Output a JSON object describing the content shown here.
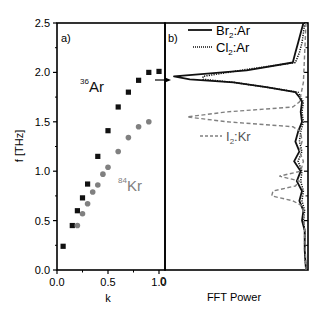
{
  "figure": {
    "panel_a_label": "a)",
    "panel_b_label": "b)",
    "ylabel": "f [THz]",
    "xlabel_a": "k",
    "xlabel_b": "FFT Power",
    "annot_ar_sup": "36",
    "annot_ar": "Ar",
    "annot_kr_sup": "84",
    "annot_kr": "Kr",
    "legend": [
      {
        "main": "Br",
        "sub": "2",
        "rest": ":Ar",
        "style": "solid"
      },
      {
        "main": "Cl",
        "sub": "2",
        "rest": ":Ar",
        "style": "dotted"
      },
      {
        "main": "I",
        "sub": "2",
        "rest": ":Kr",
        "style": "dashed"
      }
    ],
    "colors": {
      "ar": "#111111",
      "kr": "#808080",
      "axis": "#000000"
    }
  },
  "chart_data": [
    {
      "type": "scatter",
      "title": "a)",
      "xlabel": "k",
      "ylabel": "f [THz]",
      "xlim": [
        0.0,
        1.05
      ],
      "ylim": [
        0.0,
        2.5
      ],
      "xticks": [
        "0.0",
        "0.5",
        "1.0"
      ],
      "yticks": [
        "0.0",
        "0.5",
        "1.0",
        "1.5",
        "2.0",
        "2.5"
      ],
      "grid": false,
      "series": [
        {
          "name": "36Ar",
          "marker": "square",
          "color": "#111111",
          "x": [
            0.06,
            0.15,
            0.2,
            0.25,
            0.3,
            0.4,
            0.5,
            0.6,
            0.7,
            0.8,
            0.9,
            1.0
          ],
          "y": [
            0.24,
            0.45,
            0.6,
            0.73,
            0.87,
            1.15,
            1.41,
            1.65,
            1.8,
            1.92,
            2.0,
            2.01
          ]
        },
        {
          "name": "84Kr",
          "marker": "circle",
          "color": "#808080",
          "x": [
            0.2,
            0.25,
            0.3,
            0.35,
            0.4,
            0.45,
            0.5,
            0.6,
            0.7,
            0.8,
            0.9
          ],
          "y": [
            0.45,
            0.57,
            0.67,
            0.79,
            0.86,
            0.97,
            1.04,
            1.2,
            1.34,
            1.45,
            1.5
          ]
        }
      ]
    },
    {
      "type": "line",
      "title": "b)",
      "xlabel": "FFT Power",
      "ylabel": "f [THz]",
      "ylim": [
        0.0,
        2.5
      ],
      "xticks": [
        "0"
      ],
      "orientation": "horizontal spectra (power on x, frequency on y, baseline at right)",
      "grid": false,
      "legend_position": "upper left",
      "series": [
        {
          "name": "Br2:Ar",
          "style": "solid",
          "color": "#111111",
          "f": [
            2.5,
            2.4,
            2.3,
            2.2,
            2.1,
            2.02,
            1.96,
            1.93,
            1.9,
            1.85,
            1.8,
            1.75,
            1.7,
            1.6,
            1.5,
            1.4,
            1.3,
            1.2,
            1.1,
            1.0,
            0.9,
            0.8,
            0.7,
            0.6,
            0.5,
            0.4,
            0.2,
            0.0
          ],
          "power": [
            0.02,
            0.04,
            0.06,
            0.08,
            0.1,
            0.45,
            1.0,
            0.88,
            0.55,
            0.3,
            0.08,
            0.05,
            0.03,
            0.04,
            0.03,
            0.06,
            0.08,
            0.05,
            0.09,
            0.04,
            0.07,
            0.03,
            0.05,
            0.02,
            0.03,
            0.01,
            0.01,
            0.0
          ]
        },
        {
          "name": "Cl2:Ar",
          "style": "dotted",
          "color": "#111111",
          "f": [
            2.5,
            2.4,
            2.3,
            2.2,
            2.1,
            2.02,
            1.96,
            1.93,
            1.9,
            1.85,
            1.8,
            1.75,
            1.7,
            1.6,
            1.5,
            1.4,
            1.3,
            1.2,
            1.1,
            1.0,
            0.9,
            0.8,
            0.7,
            0.6,
            0.5,
            0.4,
            0.2,
            0.0
          ],
          "power": [
            0.01,
            0.02,
            0.03,
            0.05,
            0.08,
            0.5,
            0.78,
            0.78,
            0.55,
            0.3,
            0.06,
            0.04,
            0.02,
            0.03,
            0.02,
            0.04,
            0.05,
            0.03,
            0.06,
            0.03,
            0.04,
            0.02,
            0.03,
            0.01,
            0.02,
            0.01,
            0.01,
            0.0
          ]
        },
        {
          "name": "I2:Kr",
          "style": "dashed",
          "color": "#808080",
          "f": [
            2.5,
            2.2,
            1.9,
            1.7,
            1.65,
            1.6,
            1.55,
            1.5,
            1.45,
            1.4,
            1.3,
            1.2,
            1.1,
            1.0,
            0.95,
            0.9,
            0.85,
            0.8,
            0.75,
            0.7,
            0.65,
            0.6,
            0.4,
            0.0
          ],
          "power": [
            0.0,
            0.01,
            0.02,
            0.05,
            0.1,
            0.6,
            0.9,
            0.6,
            0.1,
            0.04,
            0.03,
            0.05,
            0.02,
            0.04,
            0.2,
            0.05,
            0.08,
            0.25,
            0.26,
            0.1,
            0.03,
            0.02,
            0.01,
            0.0
          ]
        }
      ]
    }
  ]
}
